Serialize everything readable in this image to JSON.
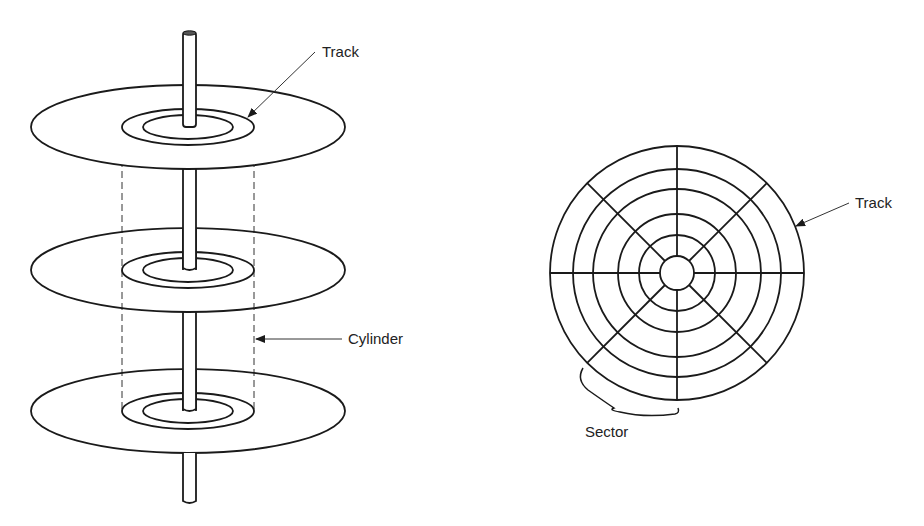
{
  "figure": {
    "left": {
      "title": "Stacked disk platters with cylinder",
      "labels": {
        "track": "Track",
        "cylinder": "Cylinder"
      },
      "platters": [
        {
          "cy": 127
        },
        {
          "cy": 270
        },
        {
          "cy": 411
        }
      ]
    },
    "right": {
      "title": "Disk surface divided into tracks and sectors",
      "labels": {
        "track": "Track",
        "sector": "Sector"
      },
      "track_count": 6,
      "sector_count": 8
    }
  }
}
